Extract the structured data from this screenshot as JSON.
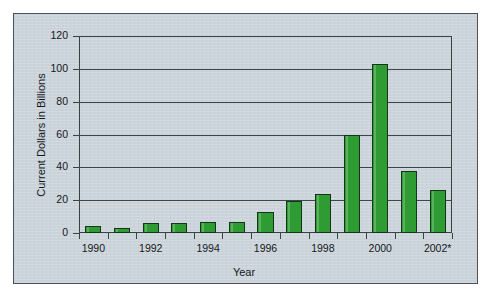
{
  "figure": {
    "panel_bg": "#ccd4db",
    "bar_color": "#2f9c33",
    "bar_outline": "#14351a",
    "axis_color": "#3a4246"
  },
  "chart_data": {
    "type": "bar",
    "title": "",
    "xlabel": "Year",
    "ylabel": "Current Dollars in Billions",
    "ylim": [
      0,
      120
    ],
    "ytick_labels": [
      "0",
      "20",
      "40",
      "60",
      "80",
      "100",
      "120"
    ],
    "ytick_values": [
      0,
      20,
      40,
      60,
      80,
      100,
      120
    ],
    "grid": true,
    "legend": "none",
    "categories": [
      "1990",
      "1991",
      "1992",
      "1993",
      "1994",
      "1995",
      "1996",
      "1997",
      "1998",
      "1999",
      "2000",
      "2001",
      "2002*"
    ],
    "xtick_labels_shown": [
      "1990",
      "1992",
      "1994",
      "1996",
      "1998",
      "2000",
      "2002*"
    ],
    "values": [
      4,
      3,
      6,
      6,
      6.5,
      7,
      13,
      19.5,
      24,
      60,
      103,
      38,
      26
    ]
  }
}
